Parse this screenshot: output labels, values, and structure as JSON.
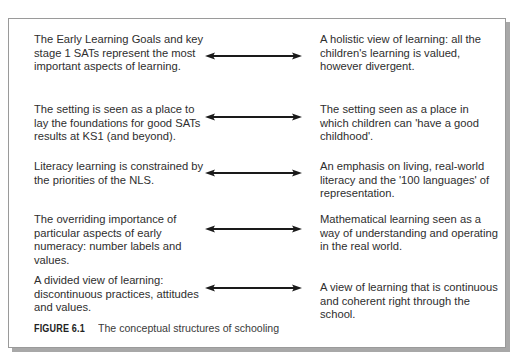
{
  "figure": {
    "label": "FIGURE 6.1",
    "title": "The conceptual structures of schooling"
  },
  "rows": [
    {
      "left": "The Early Learning Goals and key stage 1 SATs represent the most important aspects of learning.",
      "right": "A holistic view of learning: all the children's learning is valued, however divergent.",
      "connector": "double-arrow"
    },
    {
      "left": "The setting is seen as a place to lay the foundations for good SATs results at KS1 (and beyond).",
      "right": "The setting seen as a place in which children can 'have a good childhood'.",
      "connector": "double-arrow"
    },
    {
      "left": "Literacy learning is constrained by the priorities of the NLS.",
      "right": "An emphasis on living, real-world literacy and the '100 languages' of representation.",
      "connector": "double-arrow"
    },
    {
      "left": "The overriding importance of particular aspects of early numeracy: number labels and values.",
      "right": "Mathematical learning seen as a way of understanding and operating in the real world.",
      "connector": "double-arrow"
    },
    {
      "left": "A divided view of learning: discontinuous practices, attitudes and values.",
      "right": "A view of learning that is continuous and coherent right through the school.",
      "connector": "double-arrow"
    }
  ],
  "colors": {
    "border": "#9a9a9a",
    "shadow": "#a8a8a8",
    "arrow": "#1a1a1a",
    "text": "#2e2e2e"
  }
}
